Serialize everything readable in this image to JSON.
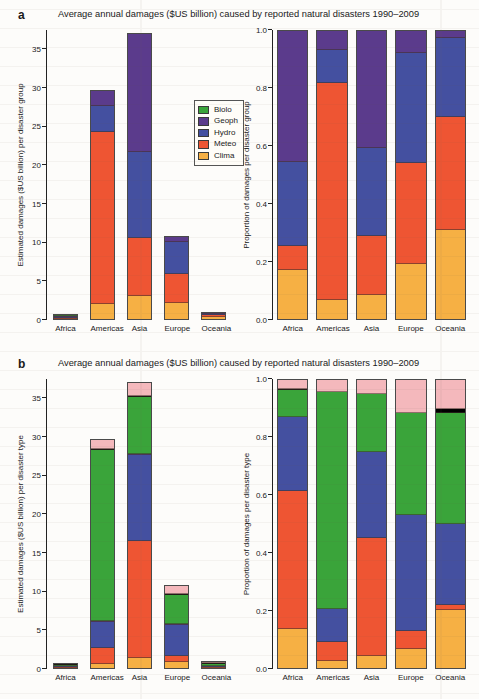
{
  "figure": {
    "background": "#fdfcfa",
    "regions": [
      "Africa",
      "Americas",
      "Asia",
      "Europe",
      "Oceania"
    ]
  },
  "panel_a": {
    "letter": "a",
    "title": "Average annual damages ($US billion) caused by reported natural disasters 1990–2009",
    "legend": [
      {
        "label": "Biolo",
        "color": "#3aa43a"
      },
      {
        "label": "Geoph",
        "color": "#5b3b8c"
      },
      {
        "label": "Hydro",
        "color": "#4450a0"
      },
      {
        "label": "Meteo",
        "color": "#ee5533"
      },
      {
        "label": "Clima",
        "color": "#f6b044"
      }
    ],
    "left": {
      "ylabel": "Estimated damages ($US billion) per disaster group",
      "yticks": [
        "0",
        "5",
        "10",
        "15",
        "20",
        "25",
        "30",
        "35"
      ]
    },
    "right": {
      "ylabel": "Proportion of damages per disaster group",
      "yticks": [
        "0.0",
        "0.2",
        "0.4",
        "0.6",
        "0.8",
        "1.0"
      ]
    }
  },
  "panel_b": {
    "letter": "b",
    "title": "Average annual damages ($US billion) caused by reported natural disasters 1990–2009",
    "legend": [
      {
        "label": "Other",
        "color": "#f4b8bc"
      },
      {
        "label": "Volca",
        "color": "#000000"
      },
      {
        "label": "Storm",
        "color": "#3aa43a"
      },
      {
        "label": "Mass",
        "color": "#5b3b8c"
      },
      {
        "label": "Flood",
        "color": "#4450a0"
      },
      {
        "label": "Earth",
        "color": "#ee5533"
      },
      {
        "label": "Droug",
        "color": "#f6b044"
      }
    ],
    "left": {
      "ylabel": "Estimated damages ($US billion) per disaster type",
      "yticks": [
        "0",
        "5",
        "10",
        "15",
        "20",
        "25",
        "30",
        "35"
      ]
    },
    "right": {
      "ylabel": "Proportion of damages per disaster type",
      "yticks": [
        "0.0",
        "0.2",
        "0.4",
        "0.6",
        "0.8",
        "1.0"
      ]
    }
  },
  "chart_data": [
    {
      "id": "a-left",
      "type": "bar",
      "stacked": true,
      "title": "Average annual damages ($US billion) caused by reported natural disasters 1990–2009",
      "xlabel": "",
      "ylabel": "Estimated damages ($US billion) per disaster group",
      "ylim": [
        0,
        37.5
      ],
      "yticks": [
        0,
        5,
        10,
        15,
        20,
        25,
        30,
        35
      ],
      "grid": false,
      "legend_position": "inside-right",
      "categories": [
        "Africa",
        "Americas",
        "Asia",
        "Europe",
        "Oceania"
      ],
      "series": [
        {
          "name": "Clima",
          "color": "#f6b044",
          "values": [
            0.02,
            2.0,
            3.0,
            2.1,
            0.35
          ]
        },
        {
          "name": "Meteo",
          "color": "#ee5533",
          "values": [
            0.03,
            22.4,
            7.5,
            3.8,
            0.3
          ]
        },
        {
          "name": "Hydro",
          "color": "#4450a0",
          "values": [
            0.05,
            3.4,
            11.2,
            4.3,
            0.25
          ]
        },
        {
          "name": "Geoph",
          "color": "#5b3b8c",
          "values": [
            0.68,
            1.9,
            15.4,
            0.7,
            0.2
          ]
        },
        {
          "name": "Biolo",
          "color": "#3aa43a",
          "values": [
            0.02,
            0.0,
            0.0,
            0.0,
            0.0
          ]
        }
      ],
      "totals": [
        0.8,
        29.7,
        37.1,
        10.9,
        1.1
      ]
    },
    {
      "id": "a-right",
      "type": "bar",
      "stacked": true,
      "normalized": true,
      "xlabel": "",
      "ylabel": "Proportion of damages per disaster group",
      "ylim": [
        0,
        1.0
      ],
      "yticks": [
        0.0,
        0.2,
        0.4,
        0.6,
        0.8,
        1.0
      ],
      "grid": false,
      "categories": [
        "Africa",
        "Americas",
        "Asia",
        "Europe",
        "Oceania"
      ],
      "series": [
        {
          "name": "Clima",
          "color": "#f6b044",
          "values": [
            0.17,
            0.065,
            0.085,
            0.19,
            0.31
          ]
        },
        {
          "name": "Meteo",
          "color": "#ee5533",
          "values": [
            0.085,
            0.755,
            0.205,
            0.35,
            0.39
          ]
        },
        {
          "name": "Hydro",
          "color": "#4450a0",
          "values": [
            0.29,
            0.115,
            0.305,
            0.385,
            0.275
          ]
        },
        {
          "name": "Geoph",
          "color": "#5b3b8c",
          "values": [
            0.455,
            0.065,
            0.405,
            0.075,
            0.025
          ]
        },
        {
          "name": "Biolo",
          "color": "#3aa43a",
          "values": [
            0.0,
            0.0,
            0.0,
            0.0,
            0.0
          ]
        }
      ]
    },
    {
      "id": "b-left",
      "type": "bar",
      "stacked": true,
      "title": "Average annual damages ($US billion) caused by reported natural disasters 1990–2009",
      "xlabel": "",
      "ylabel": "Estimated damages ($US billion) per disaster type",
      "ylim": [
        0,
        37.5
      ],
      "yticks": [
        0,
        5,
        10,
        15,
        20,
        25,
        30,
        35
      ],
      "grid": false,
      "legend_position": "inside-right",
      "categories": [
        "Africa",
        "Americas",
        "Asia",
        "Europe",
        "Oceania"
      ],
      "series": [
        {
          "name": "Droug",
          "color": "#f6b044",
          "values": [
            0.1,
            0.55,
            1.35,
            0.75,
            0.02
          ]
        },
        {
          "name": "Earth",
          "color": "#ee5533",
          "values": [
            0.42,
            2.05,
            15.3,
            0.85,
            0.02
          ]
        },
        {
          "name": "Flood",
          "color": "#4450a0",
          "values": [
            0.2,
            3.4,
            11.2,
            4.2,
            0.02
          ]
        },
        {
          "name": "Mass",
          "color": "#5b3b8c",
          "values": [
            0.0,
            0.05,
            0.05,
            0.05,
            0.0
          ]
        },
        {
          "name": "Storm",
          "color": "#3aa43a",
          "values": [
            0.03,
            22.4,
            7.45,
            3.85,
            0.92
          ]
        },
        {
          "name": "Volca",
          "color": "#000000",
          "values": [
            0.03,
            0.05,
            0.05,
            0.05,
            0.02
          ]
        },
        {
          "name": "Other",
          "color": "#f4b8bc",
          "values": [
            0.02,
            1.2,
            1.7,
            1.15,
            0.1
          ]
        }
      ],
      "totals": [
        0.8,
        29.7,
        37.1,
        10.9,
        1.1
      ]
    },
    {
      "id": "b-right",
      "type": "bar",
      "stacked": true,
      "normalized": true,
      "xlabel": "",
      "ylabel": "Proportion of damages per disaster type",
      "ylim": [
        0,
        1.0
      ],
      "yticks": [
        0.0,
        0.2,
        0.4,
        0.6,
        0.8,
        1.0
      ],
      "grid": false,
      "categories": [
        "Africa",
        "Americas",
        "Asia",
        "Europe",
        "Oceania"
      ],
      "series": [
        {
          "name": "Droug",
          "color": "#f6b044",
          "values": [
            0.135,
            0.025,
            0.04,
            0.065,
            0.2
          ]
        },
        {
          "name": "Earth",
          "color": "#ee5533",
          "values": [
            0.48,
            0.065,
            0.41,
            0.065,
            0.02
          ]
        },
        {
          "name": "Flood",
          "color": "#4450a0",
          "values": [
            0.255,
            0.115,
            0.3,
            0.4,
            0.28
          ]
        },
        {
          "name": "Mass",
          "color": "#5b3b8c",
          "values": [
            0.0,
            0.0,
            0.0,
            0.0,
            0.0
          ]
        },
        {
          "name": "Storm",
          "color": "#3aa43a",
          "values": [
            0.095,
            0.755,
            0.2,
            0.355,
            0.385
          ]
        },
        {
          "name": "Volca",
          "color": "#000000",
          "values": [
            0.005,
            0.0,
            0.0,
            0.0,
            0.015
          ]
        },
        {
          "name": "Other",
          "color": "#f4b8bc",
          "values": [
            0.03,
            0.04,
            0.05,
            0.115,
            0.1
          ]
        }
      ]
    }
  ]
}
